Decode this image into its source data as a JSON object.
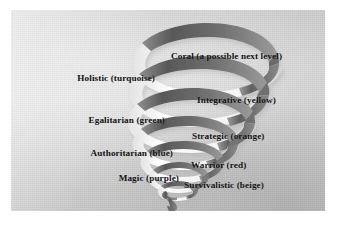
{
  "figure": {
    "background_color": "#cfcfcf",
    "page_color": "#ffffff",
    "text_color": "#111111",
    "ribbon_dark_color": "#6b6b6b",
    "ribbon_highlight_color": "#f2f2f2",
    "ribbon_shadow_color": "#4a4a4a"
  },
  "levels": [
    {
      "label": "Coral (a possible next level)",
      "name": "Coral",
      "color_word": "a possible next level",
      "side": "right",
      "order": 8
    },
    {
      "label": "Holistic (turquoise)",
      "name": "Holistic",
      "color_word": "turquoise",
      "side": "left",
      "order": 7
    },
    {
      "label": "Integrative (yellow)",
      "name": "Integrative",
      "color_word": "yellow",
      "side": "right",
      "order": 6
    },
    {
      "label": "Egalitarian (green)",
      "name": "Egalitarian",
      "color_word": "green",
      "side": "left",
      "order": 5
    },
    {
      "label": "Strategic (orange)",
      "name": "Strategic",
      "color_word": "orange",
      "side": "right",
      "order": 4
    },
    {
      "label": "Authoritarian (blue)",
      "name": "Authoritarian",
      "color_word": "blue",
      "side": "left",
      "order": 3
    },
    {
      "label": "Warrior (red)",
      "name": "Warrior",
      "color_word": "red",
      "side": "right",
      "order": 2
    },
    {
      "label": "Magic (purple)",
      "name": "Magic",
      "color_word": "purple",
      "side": "left",
      "order": 1
    },
    {
      "label": "Survivalistic (beige)",
      "name": "Survivalistic",
      "color_word": "beige",
      "side": "right",
      "order": 0
    }
  ],
  "spiral": {
    "description": "Three-dimensional ribbon spiral widening from a narrow tail at the bottom to a broad open coil at the top",
    "turn_count": 8,
    "direction": "upward-widening"
  }
}
